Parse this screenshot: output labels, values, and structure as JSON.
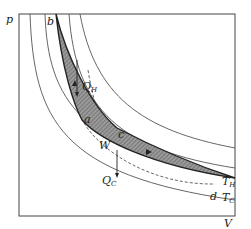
{
  "diagram": {
    "type": "Carnot cycle P-V diagram",
    "axes": {
      "y_label": "p",
      "x_label": "V"
    },
    "isotherm_labels": {
      "hot": "T",
      "hot_sub": "H",
      "cold": "T",
      "cold_sub": "C"
    },
    "points": {
      "a": "a",
      "b": "b",
      "c": "c",
      "d": "d"
    },
    "heat_labels": {
      "q_hot": "Q",
      "q_hot_sub": "H",
      "q_cold": "Q",
      "q_cold_sub": "C"
    },
    "work_label": "W",
    "colors": {
      "line": "#333333",
      "fill": "#8a8a8a",
      "background": "#ffffff"
    }
  }
}
